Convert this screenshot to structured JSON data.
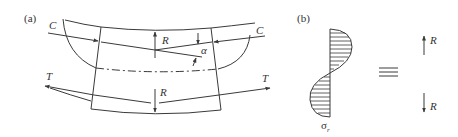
{
  "figure": {
    "panel_a": {
      "label": "(a)",
      "labels": {
        "C_left": "C",
        "C_right": "C",
        "T_left": "T",
        "T_right": "T",
        "R_top": "R",
        "R_bottom": "R",
        "alpha": "α"
      }
    },
    "panel_b": {
      "label": "(b)",
      "stress_label": "σ",
      "stress_subscript": "r",
      "equiv_symbol": "≡",
      "R_up": "R",
      "R_down": "R"
    },
    "colors": {
      "stroke": "#3a3a3a",
      "text": "#333333",
      "background": "#ffffff"
    }
  }
}
